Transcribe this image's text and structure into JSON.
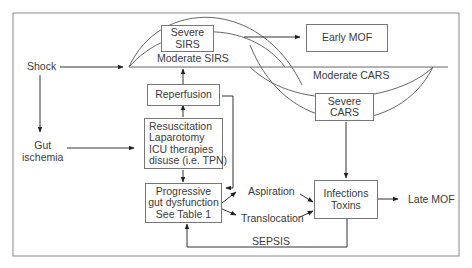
{
  "diagram": {
    "nodes": {
      "shock": "Shock",
      "gut_ischemia": [
        "Gut",
        "ischemia"
      ],
      "severe_sirs": [
        "Severe",
        "SIRS"
      ],
      "moderate_sirs": "Moderate SIRS",
      "early_mof": "Early MOF",
      "moderate_cars": "Moderate CARS",
      "severe_cars": [
        "Severe",
        "CARS"
      ],
      "reperfusion": "Reperfusion",
      "interventions": [
        "Resuscitation",
        "Laparotomy",
        "ICU therapies",
        "disuse (i.e. TPN)"
      ],
      "gut_dysfunction": [
        "Progressive",
        "gut dysfunction",
        "See Table 1"
      ],
      "aspiration": "Aspiration",
      "translocation": "Translocation",
      "infections": [
        "Infections",
        "Toxins"
      ],
      "late_mof": "Late MOF",
      "sepsis": "SEPSIS"
    },
    "edges": [
      {
        "from": "Shock",
        "to": "SIRS"
      },
      {
        "from": "Shock",
        "to": "Gut ischemia"
      },
      {
        "from": "Gut ischemia",
        "to": "Resuscitation/Laparotomy/ICU therapies"
      },
      {
        "from": "Severe SIRS",
        "to": "Early MOF"
      },
      {
        "from": "Reperfusion",
        "to": "Moderate SIRS"
      },
      {
        "from": "Resuscitation/Laparotomy/ICU therapies",
        "to": "Reperfusion"
      },
      {
        "from": "Resuscitation/Laparotomy/ICU therapies",
        "to": "Progressive gut dysfunction"
      },
      {
        "from": "Reperfusion",
        "to": "Progressive gut dysfunction"
      },
      {
        "from": "Progressive gut dysfunction",
        "to": "Aspiration"
      },
      {
        "from": "Progressive gut dysfunction",
        "to": "Translocation"
      },
      {
        "from": "Aspiration",
        "to": "Infections/Toxins"
      },
      {
        "from": "Translocation",
        "to": "Infections/Toxins"
      },
      {
        "from": "Severe CARS",
        "to": "Infections/Toxins"
      },
      {
        "from": "Infections/Toxins",
        "to": "Late MOF"
      },
      {
        "from": "Infections/Toxins",
        "to": "Progressive gut dysfunction",
        "label": "SEPSIS"
      }
    ]
  }
}
